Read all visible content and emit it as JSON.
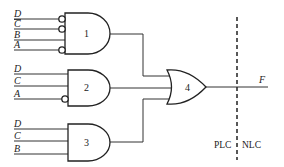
{
  "diagram": {
    "type": "logic-circuit",
    "gates": [
      {
        "id": "1",
        "kind": "AND",
        "label": "1",
        "inputs": [
          {
            "name": "D",
            "overbar": false,
            "inverted_bubble": true
          },
          {
            "name": "C",
            "overbar": true,
            "inverted_bubble": true
          },
          {
            "name": "B",
            "overbar": false,
            "inverted_bubble": false
          },
          {
            "name": "A",
            "overbar": false,
            "inverted_bubble": true
          }
        ]
      },
      {
        "id": "2",
        "kind": "AND",
        "label": "2",
        "inputs": [
          {
            "name": "D",
            "overbar": false,
            "inverted_bubble": false
          },
          {
            "name": "C",
            "overbar": false,
            "inverted_bubble": false
          },
          {
            "name": "A",
            "overbar": false,
            "inverted_bubble": true
          }
        ]
      },
      {
        "id": "3",
        "kind": "AND",
        "label": "3",
        "inputs": [
          {
            "name": "D",
            "overbar": false,
            "inverted_bubble": false
          },
          {
            "name": "C",
            "overbar": false,
            "inverted_bubble": false
          },
          {
            "name": "B",
            "overbar": false,
            "inverted_bubble": false
          }
        ]
      },
      {
        "id": "4",
        "kind": "OR",
        "label": "4",
        "inputs_from": [
          "1",
          "2",
          "3"
        ]
      }
    ],
    "output": {
      "name": "F"
    },
    "divider": {
      "left_label": "PLC",
      "right_label": "NLC",
      "style": "dashed"
    }
  }
}
